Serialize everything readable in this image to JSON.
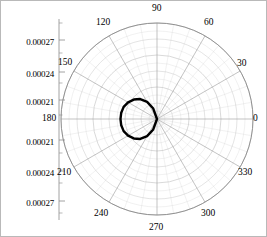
{
  "chart_data": {
    "type": "line",
    "subtype": "polar",
    "title": "",
    "xlabel": "",
    "ylabel": "",
    "grid": true,
    "legend": null,
    "center_px": {
      "x": 156,
      "y": 118
    },
    "outer_radius_px": 96,
    "angle_unit": "degrees",
    "angle_tick_labels": [
      "0",
      "30",
      "60",
      "90",
      "120",
      "150",
      "180",
      "210",
      "240",
      "270",
      "300",
      "330"
    ],
    "angle_tick_values": [
      0,
      30,
      60,
      90,
      120,
      150,
      180,
      210,
      240,
      270,
      300,
      330
    ],
    "angle_tick_step": 30,
    "radial_tick_labels_top": [
      "0.00027",
      "0.00024",
      "0.00021"
    ],
    "radial_tick_labels_bottom": [
      "0.00021",
      "0.00024",
      "0.00027"
    ],
    "radial_tick_labels_all": [
      "0.00027",
      "0.00024",
      "0.00021",
      "0.00021",
      "0.00024",
      "0.00027"
    ],
    "radial_axis_position": "left-outside",
    "radial_minor_ticks": true,
    "rlim": [
      0.00019,
      0.000282
    ],
    "series": [
      {
        "name": "pattern",
        "color": "#000000",
        "line_width": 2.4,
        "closed": false,
        "theta": [
          55,
          60,
          70,
          80,
          90,
          100,
          110,
          120,
          130,
          140,
          150,
          160,
          170,
          180,
          190,
          200,
          210,
          220,
          230,
          240,
          250,
          260,
          270,
          280,
          290,
          300,
          305
        ],
        "r": [
          0.0,
          8.2e-05,
          0.00013,
          0.000158,
          0.000176,
          0.00019,
          0.000201,
          0.000209,
          0.000215,
          0.000219,
          0.000222,
          0.000224,
          0.0002248,
          0.000225,
          0.0002248,
          0.000224,
          0.000222,
          0.000219,
          0.000215,
          0.000209,
          0.000201,
          0.00019,
          0.000176,
          0.000158,
          0.00013,
          8.2e-05,
          0.0
        ]
      }
    ],
    "grid_color": "#c9c9c9",
    "spoke_color": "#9a9a9a",
    "outer_circle_color": "#8a8a8a",
    "axis_color": "#8c8c8c",
    "frame_color": "#b9b9b9",
    "background": "#ffffff",
    "n_grid_circles": 6
  },
  "radial_labels": [
    {
      "text": "0.00027",
      "y": 36
    },
    {
      "text": "0.00024",
      "y": 68
    },
    {
      "text": "0.00021",
      "y": 96
    },
    {
      "text": "0.00021",
      "y": 136
    },
    {
      "text": "0.00024",
      "y": 167
    },
    {
      "text": "0.00027",
      "y": 197
    }
  ],
  "angle_labels": [
    {
      "text": "0",
      "x": 252,
      "y": 112
    },
    {
      "text": "30",
      "x": 236,
      "y": 57
    },
    {
      "text": "60",
      "x": 203,
      "y": 16
    },
    {
      "text": "90",
      "x": 151,
      "y": 2
    },
    {
      "text": "120",
      "x": 95,
      "y": 16
    },
    {
      "text": "150",
      "x": 57,
      "y": 56
    },
    {
      "text": "180",
      "x": 41,
      "y": 112
    },
    {
      "text": "210",
      "x": 56,
      "y": 166
    },
    {
      "text": "240",
      "x": 93,
      "y": 207
    },
    {
      "text": "270",
      "x": 148,
      "y": 221
    },
    {
      "text": "300",
      "x": 200,
      "y": 207
    },
    {
      "text": "330",
      "x": 237,
      "y": 166
    }
  ]
}
